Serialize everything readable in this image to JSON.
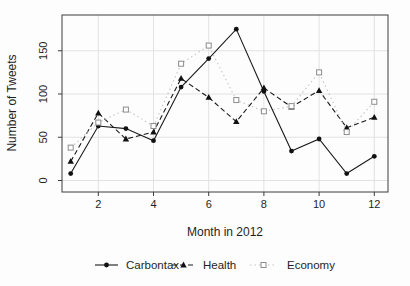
{
  "background": "#fdfdfd",
  "chart_data": {
    "type": "line",
    "title": "",
    "xlabel": "Month in 2012",
    "ylabel": "Number of Tweets",
    "x": [
      1,
      2,
      3,
      4,
      5,
      6,
      7,
      8,
      9,
      10,
      11,
      12
    ],
    "x_ticks": [
      2,
      4,
      6,
      8,
      10,
      12
    ],
    "y_ticks": [
      0,
      50,
      100,
      150
    ],
    "xlim": [
      0.6,
      12.5
    ],
    "ylim": [
      -13,
      191
    ],
    "grid": true,
    "legend_position": "bottom",
    "axis_color": "#3c3c3c",
    "grid_color": "#e2e2e2",
    "series": [
      {
        "name": "Carbontax",
        "marker": "filled-circle",
        "line_style": "solid",
        "line_color": "#1a1a1a",
        "marker_color": "#111111",
        "values": [
          8,
          63,
          60,
          46,
          108,
          141,
          175,
          103,
          34,
          48,
          8,
          28
        ]
      },
      {
        "name": "Health",
        "marker": "filled-triangle",
        "line_style": "dashed",
        "line_color": "#1a1a1a",
        "marker_color": "#111111",
        "values": [
          22,
          78,
          48,
          56,
          118,
          96,
          68,
          107,
          85,
          104,
          61,
          73
        ]
      },
      {
        "name": "Economy",
        "marker": "open-square",
        "line_style": "dotted",
        "line_color": "#c4c4c4",
        "marker_color": "#8c8c8c",
        "values": [
          38,
          67,
          82,
          63,
          135,
          156,
          93,
          80,
          86,
          125,
          56,
          91
        ]
      }
    ]
  }
}
